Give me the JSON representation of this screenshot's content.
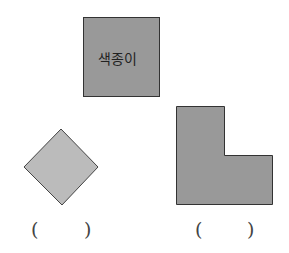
{
  "figure": {
    "reference_shape": {
      "label": "색종이",
      "fill": "#999999",
      "stroke": "#333333"
    },
    "shape_a": {
      "type": "rotated-square",
      "fill": "#bbbbbb",
      "stroke": "#444444"
    },
    "shape_b": {
      "type": "L-shape",
      "fill": "#999999",
      "stroke": "#333333"
    },
    "answer_blanks": [
      {
        "open": "(",
        "close": ")"
      },
      {
        "open": "(",
        "close": ")"
      }
    ]
  }
}
